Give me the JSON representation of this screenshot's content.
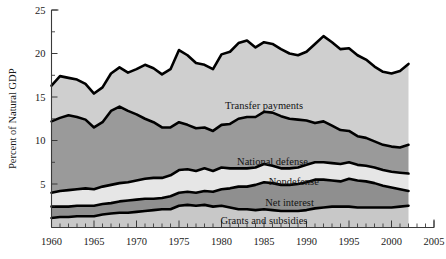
{
  "chart_data": {
    "type": "area",
    "stacked": true,
    "title": "",
    "xlabel": "",
    "ylabel": "Percent of Natural GDP",
    "xlim": [
      1960,
      2005
    ],
    "ylim": [
      0,
      25
    ],
    "grid": false,
    "legend_position": "inline-labels",
    "x_ticks": [
      1960,
      1965,
      1970,
      1975,
      1980,
      1985,
      1990,
      1995,
      2000,
      2005
    ],
    "x_tick_labels": [
      "1960",
      "1965",
      "1970",
      "1975",
      "1980",
      "1985",
      "1990",
      "1995",
      "2000",
      "2005"
    ],
    "x_minor_tick_step": 1,
    "y_ticks": [
      5,
      10,
      15,
      20,
      25
    ],
    "y_tick_labels": [
      "5",
      "10",
      "15",
      "20",
      "25"
    ],
    "y_minor_tick_step": 2.5,
    "x": [
      1960,
      1961,
      1962,
      1963,
      1964,
      1965,
      1966,
      1967,
      1968,
      1969,
      1970,
      1971,
      1972,
      1973,
      1974,
      1975,
      1976,
      1977,
      1978,
      1979,
      1980,
      1981,
      1982,
      1983,
      1984,
      1985,
      1986,
      1987,
      1988,
      1989,
      1990,
      1991,
      1992,
      1993,
      1994,
      1995,
      1996,
      1997,
      1998,
      1999,
      2000,
      2001,
      2002
    ],
    "series": [
      {
        "name": "Grants and subsidies",
        "color": "#c8c8c8",
        "label_x": 1985.0,
        "label_y": 0.85,
        "values": [
          1.1,
          1.2,
          1.2,
          1.3,
          1.3,
          1.3,
          1.5,
          1.6,
          1.7,
          1.7,
          1.8,
          1.9,
          2.0,
          2.1,
          2.1,
          2.5,
          2.6,
          2.5,
          2.6,
          2.4,
          2.5,
          2.3,
          2.1,
          2.1,
          2.0,
          2.1,
          2.0,
          1.9,
          1.9,
          1.9,
          2.0,
          2.2,
          2.3,
          2.4,
          2.4,
          2.4,
          2.3,
          2.3,
          2.3,
          2.3,
          2.3,
          2.4,
          2.5
        ]
      },
      {
        "name": "Net interest",
        "color": "#8f8f8f",
        "label_x": 1988.0,
        "label_y": 2.9,
        "values": [
          1.3,
          1.2,
          1.2,
          1.2,
          1.2,
          1.2,
          1.2,
          1.2,
          1.3,
          1.4,
          1.4,
          1.4,
          1.3,
          1.3,
          1.5,
          1.5,
          1.5,
          1.5,
          1.6,
          1.7,
          1.9,
          2.2,
          2.6,
          2.6,
          2.9,
          3.1,
          3.1,
          3.0,
          3.0,
          3.1,
          3.2,
          3.3,
          3.2,
          3.0,
          2.9,
          3.2,
          3.1,
          3.0,
          2.8,
          2.5,
          2.3,
          2.0,
          1.7
        ]
      },
      {
        "name": "Nondefense",
        "color": "#e6e6e6",
        "label_x": 1988.5,
        "label_y": 5.3,
        "values": [
          1.6,
          1.8,
          1.9,
          1.9,
          2.0,
          1.9,
          2.0,
          2.1,
          2.1,
          2.1,
          2.2,
          2.3,
          2.4,
          2.3,
          2.4,
          2.6,
          2.6,
          2.5,
          2.6,
          2.4,
          2.5,
          2.3,
          2.1,
          2.1,
          2.0,
          2.1,
          2.0,
          1.9,
          1.9,
          1.9,
          2.0,
          2.0,
          2.0,
          2.0,
          2.0,
          1.9,
          1.8,
          1.8,
          1.8,
          1.8,
          1.8,
          1.9,
          2.0
        ]
      },
      {
        "name": "National defense",
        "color": "#9a9a9a",
        "label_x": 1986.0,
        "label_y": 7.6,
        "values": [
          8.2,
          8.4,
          8.6,
          8.3,
          7.9,
          7.1,
          7.4,
          8.5,
          8.8,
          8.2,
          7.6,
          6.9,
          6.4,
          5.8,
          5.5,
          5.5,
          5.1,
          4.9,
          4.7,
          4.6,
          4.9,
          5.1,
          5.7,
          5.9,
          5.8,
          6.0,
          6.1,
          6.0,
          5.7,
          5.5,
          5.1,
          4.5,
          4.7,
          4.3,
          3.9,
          3.6,
          3.3,
          3.2,
          3.0,
          2.9,
          2.9,
          2.9,
          3.3
        ]
      },
      {
        "name": "Transfer payments",
        "color": "#cfcfcf",
        "label_x": 1985.0,
        "label_y": 14.0,
        "values": [
          4.1,
          4.8,
          4.3,
          4.3,
          4.1,
          3.9,
          4.0,
          4.3,
          4.5,
          4.4,
          5.2,
          6.2,
          6.2,
          6.1,
          6.7,
          8.3,
          8.0,
          7.5,
          7.2,
          7.1,
          8.1,
          8.3,
          8.7,
          8.8,
          8.0,
          8.0,
          7.9,
          7.7,
          7.5,
          7.4,
          7.9,
          9.1,
          9.8,
          9.6,
          9.3,
          9.5,
          9.3,
          9.0,
          8.6,
          8.4,
          8.4,
          8.8,
          9.3
        ]
      }
    ]
  }
}
